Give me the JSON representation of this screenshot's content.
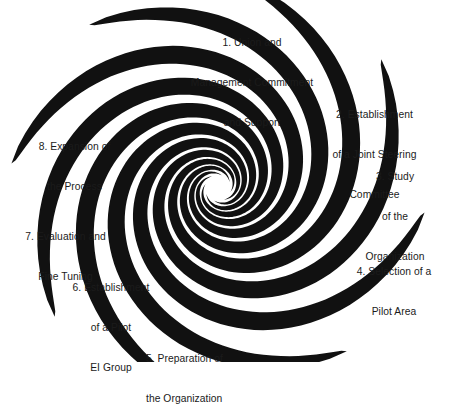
{
  "figure": {
    "type": "spiral-pinwheel-diagram",
    "arm_count": 8,
    "colors": {
      "arm_fill": "#111111",
      "background": "#ffffff",
      "text": "#1b1b1b"
    }
  },
  "steps": [
    {
      "number": "1.",
      "lines": [
        "1. Union and",
        "Management Commitment",
        "and Support"
      ],
      "align": "center"
    },
    {
      "number": "2.",
      "lines": [
        "2. Establishment",
        "of a Joint Steering",
        "Committee"
      ],
      "align": "center"
    },
    {
      "number": "3.",
      "lines": [
        "3. Study",
        "of the",
        "Organization"
      ],
      "align": "center"
    },
    {
      "number": "4.",
      "lines": [
        "4. Selection of a",
        "Pilot Area"
      ],
      "align": "center"
    },
    {
      "number": "5.",
      "lines": [
        "5. Preparation of",
        "the Organization"
      ],
      "align": "left"
    },
    {
      "number": "6.",
      "lines": [
        "6. Establishment",
        "of a Pilot",
        "EI Group"
      ],
      "align": "center"
    },
    {
      "number": "7.",
      "lines": [
        "7. Evaluation and",
        "Fine Tuning"
      ],
      "align": "center"
    },
    {
      "number": "8.",
      "lines": [
        "8. Expansion of",
        "the Process"
      ],
      "align": "center"
    }
  ]
}
